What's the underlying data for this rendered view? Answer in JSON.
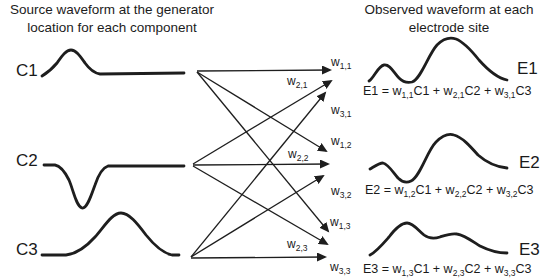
{
  "colors": {
    "ink": "#1e1e1e",
    "background": "#ffffff"
  },
  "left_panel": {
    "title_line1": "Source waveform at the generator",
    "title_line2": "location for each component",
    "components": [
      {
        "label": "C1",
        "waveform": "positive bump then flat"
      },
      {
        "label": "C2",
        "waveform": "negative dip then flat"
      },
      {
        "label": "C3",
        "waveform": "flat then broad positive bump"
      }
    ]
  },
  "right_panel": {
    "title_line1": "Observed waveform at each",
    "title_line2": "electrode site",
    "electrodes": [
      {
        "label": "E1",
        "equation": [
          {
            "t": "E1 = w"
          },
          {
            "s": "1,1"
          },
          {
            "t": "C1 + w"
          },
          {
            "s": "2,1"
          },
          {
            "t": "C2 + w"
          },
          {
            "s": "3,1"
          },
          {
            "t": "C3"
          }
        ]
      },
      {
        "label": "E2",
        "equation": [
          {
            "t": "E2 = w"
          },
          {
            "s": "1,2"
          },
          {
            "t": "C1 + w"
          },
          {
            "s": "2,2"
          },
          {
            "t": "C2 + w"
          },
          {
            "s": "3,2"
          },
          {
            "t": "C3"
          }
        ]
      },
      {
        "label": "E3",
        "equation": [
          {
            "t": "E3 = w"
          },
          {
            "s": "1,3"
          },
          {
            "t": "C1 + w"
          },
          {
            "s": "2,3"
          },
          {
            "t": "C2 + w"
          },
          {
            "s": "3,3"
          },
          {
            "t": "C3"
          }
        ]
      }
    ]
  },
  "weights": [
    {
      "base": "w",
      "sub": "1,1",
      "from": "C1",
      "to": "E1"
    },
    {
      "base": "w",
      "sub": "2,1",
      "from": "C2",
      "to": "E1"
    },
    {
      "base": "w",
      "sub": "3,1",
      "from": "C3",
      "to": "E1"
    },
    {
      "base": "w",
      "sub": "1,2",
      "from": "C1",
      "to": "E2"
    },
    {
      "base": "w",
      "sub": "2,2",
      "from": "C2",
      "to": "E2"
    },
    {
      "base": "w",
      "sub": "3,2",
      "from": "C3",
      "to": "E2"
    },
    {
      "base": "w",
      "sub": "1,3",
      "from": "C1",
      "to": "E3"
    },
    {
      "base": "w",
      "sub": "2,3",
      "from": "C2",
      "to": "E3"
    },
    {
      "base": "w",
      "sub": "3,3",
      "from": "C3",
      "to": "E3"
    }
  ]
}
